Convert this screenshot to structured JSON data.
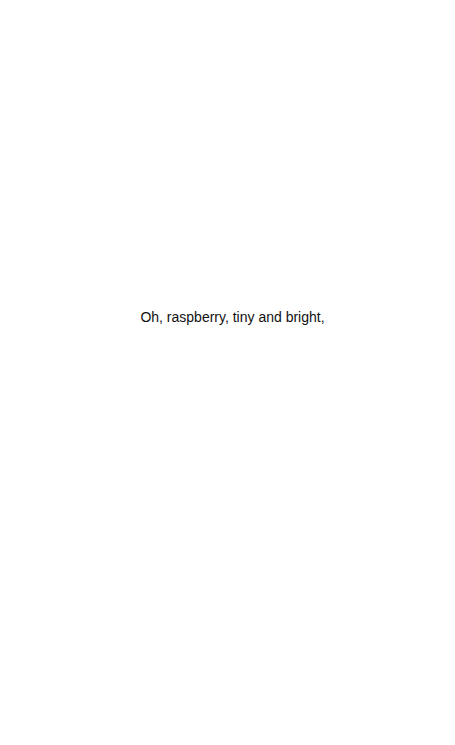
{
  "document": {
    "lines": [
      "Oh, raspberry, tiny and bright,"
    ]
  },
  "colors": {
    "background": "#ffffff",
    "text": "#111111"
  }
}
